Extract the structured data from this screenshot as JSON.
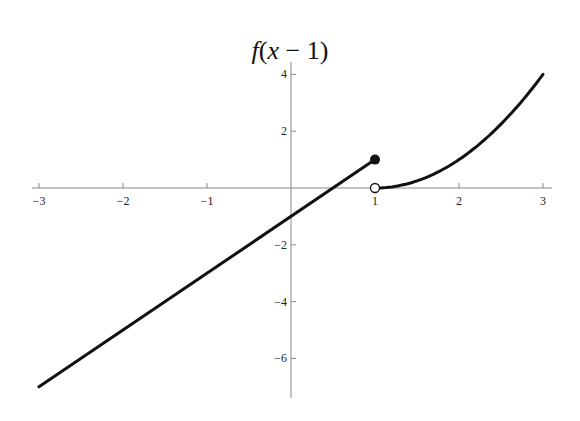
{
  "chart_data": {
    "type": "line",
    "title": "f(x − 1)",
    "xlabel": "",
    "ylabel": "",
    "xlim": [
      -3,
      3.1
    ],
    "ylim": [
      -7.4,
      4.3
    ],
    "x_ticks": [
      -3,
      -2,
      -1,
      1,
      2,
      3
    ],
    "x_tick_labels": [
      "−3",
      "−2",
      "−1",
      "1",
      "2",
      "3"
    ],
    "y_ticks": [
      -6,
      -4,
      -2,
      2,
      4
    ],
    "y_tick_labels": [
      "−6",
      "−4",
      "−2",
      "2",
      "4"
    ],
    "grid": false,
    "legend": null,
    "series": [
      {
        "name": "left piece (y = 2x − 1, x ≤ 1)",
        "x": [
          -3,
          1
        ],
        "y": [
          -7,
          1
        ],
        "endpoint": {
          "x": 1,
          "y": 1,
          "style": "closed"
        }
      },
      {
        "name": "right piece (y = (x − 1)², x > 1)",
        "x": [
          1,
          1.5,
          2,
          2.5,
          3
        ],
        "y": [
          0,
          0.25,
          1,
          2.25,
          4
        ],
        "endpoint": {
          "x": 1,
          "y": 0,
          "style": "open"
        }
      }
    ],
    "colors": {
      "line": "#111111",
      "axis": "#888888"
    }
  }
}
